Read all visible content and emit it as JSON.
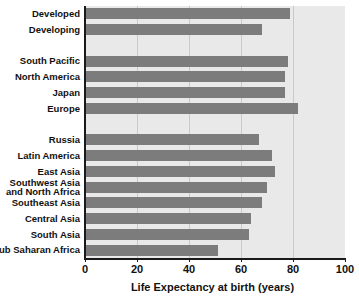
{
  "chart_data": {
    "type": "bar",
    "orientation": "horizontal",
    "title": "",
    "xlabel": "Life Expectancy at birth (years)",
    "ylabel": "",
    "xlim": [
      0,
      100
    ],
    "xticks": [
      0,
      20,
      40,
      60,
      80,
      100
    ],
    "xtick_labels": [
      "0",
      "20",
      "40",
      "60",
      "80",
      "100"
    ],
    "grid": true,
    "grid_axis": "x",
    "legend": false,
    "bar_color": "#7c7c7c",
    "plot_background": "#e9e9e9",
    "axis_color": "#1a1a1a",
    "categories": [
      "Developed",
      "Developing",
      "South Pacific",
      "North America",
      "Japan",
      "Europe",
      "Russia",
      "Latin America",
      "East Asia",
      "Southwest Asia and North Africa",
      "Southeast Asia",
      "Central Asia",
      "South Asia",
      "Sub Saharan Africa"
    ],
    "values": [
      79,
      68,
      78,
      77,
      77,
      82,
      67,
      72,
      73,
      70,
      68,
      64,
      63,
      51
    ],
    "bars": [
      {
        "label": "Developed",
        "label_lines": [
          "Developed"
        ],
        "value": 79,
        "row": 0
      },
      {
        "label": "Developing",
        "label_lines": [
          "Developing"
        ],
        "value": 68,
        "row": 1
      },
      {
        "label": "South Pacific",
        "label_lines": [
          "South Pacific"
        ],
        "value": 78,
        "row": 3
      },
      {
        "label": "North America",
        "label_lines": [
          "North America"
        ],
        "value": 77,
        "row": 4
      },
      {
        "label": "Japan",
        "label_lines": [
          "Japan"
        ],
        "value": 77,
        "row": 5
      },
      {
        "label": "Europe",
        "label_lines": [
          "Europe"
        ],
        "value": 82,
        "row": 6
      },
      {
        "label": "Russia",
        "label_lines": [
          "Russia"
        ],
        "value": 67,
        "row": 8
      },
      {
        "label": "Latin America",
        "label_lines": [
          "Latin America"
        ],
        "value": 72,
        "row": 9
      },
      {
        "label": "East Asia",
        "label_lines": [
          "East Asia"
        ],
        "value": 73,
        "row": 10
      },
      {
        "label": "Southwest Asia and North Africa",
        "label_lines": [
          "Southwest Asia",
          "and North Africa"
        ],
        "value": 70,
        "row": 11
      },
      {
        "label": "Southeast Asia",
        "label_lines": [
          "Southeast Asia"
        ],
        "value": 68,
        "row": 12
      },
      {
        "label": "Central Asia",
        "label_lines": [
          "Central Asia"
        ],
        "value": 64,
        "row": 13
      },
      {
        "label": "South Asia",
        "label_lines": [
          "South Asia"
        ],
        "value": 63,
        "row": 14
      },
      {
        "label": "Sub Saharan Africa",
        "label_lines": [
          "Sub Saharan Africa"
        ],
        "value": 51,
        "row": 15
      }
    ]
  }
}
